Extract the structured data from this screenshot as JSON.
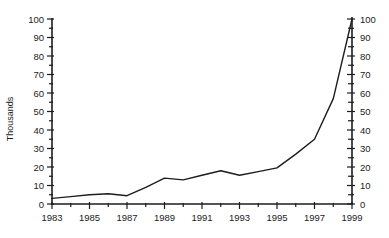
{
  "chart_data": {
    "type": "line",
    "title": "",
    "xlabel": "",
    "ylabel": "Thousands",
    "x": [
      1983,
      1984,
      1985,
      1986,
      1987,
      1988,
      1989,
      1990,
      1991,
      1992,
      1993,
      1994,
      1995,
      1996,
      1997,
      1998,
      1999
    ],
    "values": [
      3,
      4,
      5,
      5.5,
      4.5,
      9,
      14,
      13,
      15.5,
      18,
      15.5,
      17.5,
      19.5,
      27,
      35,
      57,
      100
    ],
    "series_name": "value-thousands",
    "ylim": [
      0,
      100
    ],
    "y_major_step": 10,
    "y_minor_step": 5,
    "x_labeled_ticks": [
      "1983",
      "1985",
      "1987",
      "1989",
      "1991",
      "1993",
      "1995",
      "1997",
      "1999"
    ],
    "y_tick_labels": [
      "0",
      "10",
      "20",
      "30",
      "40",
      "50",
      "60",
      "70",
      "80",
      "90",
      "100"
    ],
    "dual_y_axis": true,
    "grid": false,
    "legend": "none",
    "line_color": "#1d1d1d",
    "axis_color": "#1d1d1d",
    "background_color": "#ffffff"
  }
}
